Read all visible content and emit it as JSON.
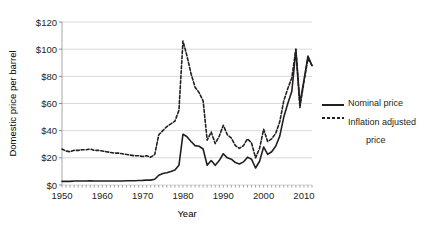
{
  "chart_data": {
    "type": "line",
    "title": "",
    "xlabel": "Year",
    "ylabel": "Domestic price per barrel",
    "xlim": [
      1950,
      2012
    ],
    "ylim": [
      0,
      120
    ],
    "grid": true,
    "legend_position": "right",
    "y_ticks": [
      "$0",
      "$20",
      "$40",
      "$60",
      "$80",
      "$100",
      "$120"
    ],
    "y_tick_values": [
      0,
      20,
      40,
      60,
      80,
      100,
      120
    ],
    "x_ticks": [
      "1950",
      "1960",
      "1970",
      "1980",
      "1990",
      "2000",
      "2010"
    ],
    "x_tick_values": [
      1950,
      1960,
      1970,
      1980,
      1990,
      2000,
      2010
    ],
    "colors": {
      "nominal": "#231f20",
      "adjusted": "#231f20",
      "grid": "#d9d9d9",
      "background": "#ffffff"
    },
    "x": [
      1950,
      1951,
      1952,
      1953,
      1954,
      1955,
      1956,
      1957,
      1958,
      1959,
      1960,
      1961,
      1962,
      1963,
      1964,
      1965,
      1966,
      1967,
      1968,
      1969,
      1970,
      1971,
      1972,
      1973,
      1974,
      1975,
      1976,
      1977,
      1978,
      1979,
      1980,
      1981,
      1982,
      1983,
      1984,
      1985,
      1986,
      1987,
      1988,
      1989,
      1990,
      1991,
      1992,
      1993,
      1994,
      1995,
      1996,
      1997,
      1998,
      1999,
      2000,
      2001,
      2002,
      2003,
      2004,
      2005,
      2006,
      2007,
      2008,
      2009,
      2010,
      2011,
      2012
    ],
    "series": [
      {
        "name": "Nominal price",
        "style": "solid",
        "values": [
          2.7,
          2.7,
          2.7,
          2.9,
          2.9,
          2.9,
          2.9,
          3.1,
          3.0,
          3.0,
          3.0,
          3.0,
          3.0,
          3.0,
          3.0,
          3.0,
          3.1,
          3.1,
          3.1,
          3.3,
          3.4,
          3.6,
          3.6,
          4.2,
          7.2,
          8.4,
          9.0,
          10.0,
          11.0,
          14.5,
          37.4,
          35.5,
          32.0,
          29.0,
          28.5,
          26.5,
          14.5,
          18.0,
          14.5,
          18.0,
          23.0,
          20.0,
          19.0,
          16.5,
          15.5,
          17.0,
          20.5,
          19.0,
          12.5,
          17.5,
          28.0,
          22.5,
          24.5,
          28.5,
          36.0,
          50.0,
          60.0,
          69.0,
          99.5,
          60.0,
          77.0,
          95.0,
          88.0
        ]
      },
      {
        "name": "Inflation adjusted price",
        "style": "dashed",
        "values": [
          26.5,
          25.0,
          24.5,
          25.5,
          25.5,
          26.0,
          26.0,
          26.5,
          25.5,
          25.5,
          25.0,
          24.5,
          24.0,
          23.5,
          23.5,
          23.0,
          22.5,
          22.0,
          21.5,
          21.5,
          21.0,
          21.5,
          20.5,
          22.5,
          37.0,
          40.0,
          43.0,
          45.0,
          47.0,
          55.0,
          106.0,
          95.0,
          82.0,
          72.0,
          68.0,
          62.0,
          33.0,
          39.0,
          30.5,
          36.0,
          44.0,
          37.0,
          34.5,
          29.0,
          27.0,
          29.0,
          34.0,
          31.0,
          20.0,
          27.0,
          41.0,
          32.0,
          34.0,
          38.0,
          46.5,
          62.0,
          71.0,
          79.0,
          100.0,
          57.0,
          76.0,
          93.0,
          88.0
        ]
      }
    ]
  },
  "legend": {
    "entries": [
      {
        "label": "Nominal price"
      },
      {
        "label": "Inflation adjusted",
        "label2": "price"
      }
    ]
  }
}
